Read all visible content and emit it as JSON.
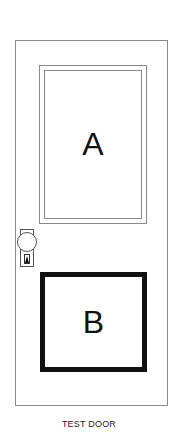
{
  "figure": {
    "caption": "TEST DOOR",
    "panels": [
      {
        "id": "A",
        "label": "A",
        "style": "thin double border"
      },
      {
        "id": "B",
        "label": "B",
        "style": "thick black border"
      }
    ],
    "hardware": {
      "knob": "doorknob-icon",
      "keyhole": "keyhole-icon"
    }
  }
}
